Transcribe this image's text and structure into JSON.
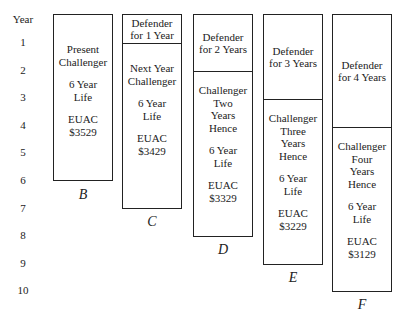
{
  "axis": {
    "title": "Year",
    "ticks": [
      "1",
      "2",
      "3",
      "4",
      "5",
      "6",
      "7",
      "8",
      "9",
      "10"
    ]
  },
  "alternatives": [
    {
      "id": "B",
      "label": "B",
      "defender": null,
      "challenger": [
        "Present",
        "Challenger"
      ],
      "life": [
        "6 Year",
        "Life"
      ],
      "euac": [
        "EUAC",
        "$3529"
      ]
    },
    {
      "id": "C",
      "label": "C",
      "defender": [
        "Defender",
        "for 1 Year"
      ],
      "challenger": [
        "Next Year",
        "Challenger"
      ],
      "life": [
        "6 Year",
        "Life"
      ],
      "euac": [
        "EUAC",
        "$3429"
      ]
    },
    {
      "id": "D",
      "label": "D",
      "defender": [
        "Defender",
        "for 2 Years"
      ],
      "challenger": [
        "Challenger",
        "Two",
        "Years",
        "Hence"
      ],
      "life": [
        "6 Year",
        "Life"
      ],
      "euac": [
        "EUAC",
        "$3329"
      ]
    },
    {
      "id": "E",
      "label": "E",
      "defender": [
        "Defender",
        "for 3 Years"
      ],
      "challenger": [
        "Challenger",
        "Three",
        "Years",
        "Hence"
      ],
      "life": [
        "6 Year",
        "Life"
      ],
      "euac": [
        "EUAC",
        "$3229"
      ]
    },
    {
      "id": "F",
      "label": "F",
      "defender": [
        "Defender",
        "for 4 Years"
      ],
      "challenger": [
        "Challenger",
        "Four",
        "Years",
        "Hence"
      ],
      "life": [
        "6 Year",
        "Life"
      ],
      "euac": [
        "EUAC",
        "$3129"
      ]
    }
  ]
}
